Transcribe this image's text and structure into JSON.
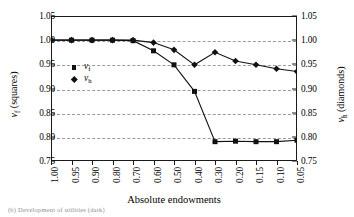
{
  "chart_data": {
    "type": "line",
    "title": "",
    "xlabel": "Absolute endowments",
    "ylabel": "v_f (squares)",
    "ylabel_right": "v_h (diamonds)",
    "categories": [
      "1.00",
      "0.95",
      "0.90",
      "0.80",
      "0.70",
      "0.60",
      "0.50",
      "0.40",
      "0.30",
      "0.20",
      "0.15",
      "0.10",
      "0.05"
    ],
    "ylim": [
      0.75,
      1.05
    ],
    "yticks": [
      "1.05",
      "1.00",
      "0.95",
      "0.90",
      "0.85",
      "0.80",
      "0.75"
    ],
    "ytick_values": [
      1.05,
      1.0,
      0.95,
      0.9,
      0.85,
      0.8,
      0.75
    ],
    "yticks_right": [
      "1.05",
      "1.00",
      "0.95",
      "0.90",
      "0.85",
      "0.80",
      "0.75"
    ],
    "grid": true,
    "grid_axis": "y",
    "legend_position": "inside-left",
    "series": [
      {
        "name": "v_f",
        "marker": "square",
        "axis": "left",
        "color": "#111111",
        "values": [
          1.0,
          1.0,
          1.0,
          1.0,
          0.999,
          0.978,
          0.949,
          0.894,
          0.79,
          0.791,
          0.79,
          0.79,
          0.793
        ]
      },
      {
        "name": "v_h",
        "marker": "diamond",
        "axis": "right",
        "color": "#111111",
        "values": [
          1.0,
          1.0,
          1.0,
          1.0,
          1.0,
          0.995,
          0.98,
          0.949,
          0.975,
          0.957,
          0.949,
          0.941,
          0.935
        ]
      }
    ]
  },
  "axes": {
    "ylabel_left_var": "v",
    "ylabel_left_sub": "f",
    "ylabel_left_suffix": " (squares)",
    "ylabel_right_var": "v",
    "ylabel_right_sub": "h",
    "ylabel_right_suffix": " (diamonds)",
    "xlabel": "Absolute endowments"
  },
  "legend": {
    "items": [
      {
        "marker": "square-marker",
        "var": "v",
        "sub": "f"
      },
      {
        "marker": "diamond-marker",
        "var": "v",
        "sub": "h"
      }
    ]
  },
  "caption": {
    "text": "(b) Development of utilities (dark)"
  }
}
